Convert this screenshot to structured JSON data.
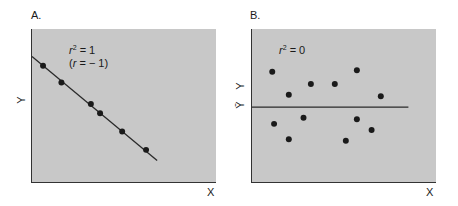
{
  "chart_data": [
    {
      "type": "scatter",
      "panel": "A.",
      "title": "",
      "xlabel": "X",
      "ylabel": "Y",
      "xlim": [
        0,
        10
      ],
      "ylim": [
        0,
        10
      ],
      "grid": false,
      "annotations": [
        "r² = 1",
        "(r = −1)"
      ],
      "points": [
        {
          "x": 0.6,
          "y": 7.6
        },
        {
          "x": 1.6,
          "y": 6.5
        },
        {
          "x": 3.2,
          "y": 5.1
        },
        {
          "x": 3.7,
          "y": 4.5
        },
        {
          "x": 4.9,
          "y": 3.3
        },
        {
          "x": 6.2,
          "y": 2.1
        }
      ],
      "line": {
        "label": "regression line",
        "x0": 0,
        "y0": 8.2,
        "x1": 6.8,
        "y1": 1.4
      }
    },
    {
      "type": "scatter",
      "panel": "B.",
      "title": "",
      "xlabel": "X",
      "ylabel": "Y",
      "xlim": [
        0,
        10
      ],
      "ylim": [
        0,
        10
      ],
      "grid": false,
      "annotations": [
        "r² = 0"
      ],
      "mean_line_label": "Ȳ",
      "points": [
        {
          "x": 1.1,
          "y": 7.2
        },
        {
          "x": 2.0,
          "y": 5.7
        },
        {
          "x": 3.2,
          "y": 6.4
        },
        {
          "x": 4.5,
          "y": 6.4
        },
        {
          "x": 5.7,
          "y": 7.3
        },
        {
          "x": 7.0,
          "y": 5.6
        },
        {
          "x": 1.2,
          "y": 3.8
        },
        {
          "x": 2.8,
          "y": 4.2
        },
        {
          "x": 2.0,
          "y": 2.8
        },
        {
          "x": 5.1,
          "y": 2.7
        },
        {
          "x": 5.7,
          "y": 4.1
        },
        {
          "x": 6.5,
          "y": 3.4
        }
      ],
      "line": {
        "label": "mean of Y",
        "x0": 0,
        "y0": 4.9,
        "x1": 8.5,
        "y1": 4.9
      }
    }
  ],
  "panels": {
    "a": {
      "label": "A.",
      "r2_prefix": "r",
      "r2_sup": "2",
      "r2_value": " = 1",
      "r_text_open": "(",
      "r_italic": "r",
      "r_text_rest": " = − 1)",
      "xlabel": "X",
      "ylabel": "Y"
    },
    "b": {
      "label": "B.",
      "r2_prefix": "r",
      "r2_sup": "2",
      "r2_value": " = 0",
      "xlabel": "X",
      "ylabel": "Y",
      "mean_label": "Ȳ"
    }
  },
  "colors": {
    "plot_bg": "#c8c8c8",
    "axis": "#333333",
    "point": "#1a1a1a",
    "line": "#2a2a2a"
  }
}
